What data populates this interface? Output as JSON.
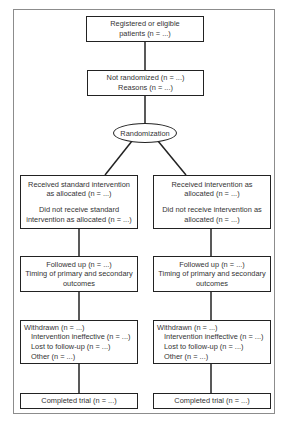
{
  "diagram": {
    "type": "flowchart",
    "title": "",
    "top": {
      "registered": {
        "lines": [
          "Registered or eligible",
          "patients (n = ...)"
        ]
      },
      "not_randomized": {
        "lines": [
          "Not randomized (n = ...)",
          "Reasons (n = ...)"
        ]
      },
      "randomization": {
        "label": "Randomization"
      }
    },
    "left_arm": {
      "allocation": {
        "lines_a": [
          "Received standard intervention",
          "as allocated (n = ...)"
        ],
        "lines_b": [
          "Did not receive standard",
          "intervention as allocated (n = ...)"
        ]
      },
      "follow_up": {
        "lines": [
          "Followed up (n = ...)",
          "Timing of primary and secondary",
          "outcomes"
        ]
      },
      "withdrawn": {
        "heading": "Withdrawn (n = ...)",
        "items": [
          "Intervention ineffective (n = ...)",
          "Lost to follow-up (n = ...)",
          "Other (n = ...)"
        ]
      },
      "completed": {
        "label": "Completed trial (n = ...)"
      }
    },
    "right_arm": {
      "allocation": {
        "lines_a": [
          "Received intervention as",
          "allocated (n = ...)"
        ],
        "lines_b": [
          "Did not receive intervention as",
          "allocated (n = ...)"
        ]
      },
      "follow_up": {
        "lines": [
          "Followed up (n = ...)",
          "Timing of primary and secondary",
          "outcomes"
        ]
      },
      "withdrawn": {
        "heading": "Withdrawn (n = ...)",
        "items": [
          "Intervention ineffective (n = ...)",
          "Lost to follow-up (n = ...)",
          "Other (n = ...)"
        ]
      },
      "completed": {
        "label": "Completed trial (n = ...)"
      }
    },
    "colors": {
      "stroke": "#222222",
      "frame": "#8c8c8c",
      "text": "#333333",
      "background": "#ffffff"
    }
  }
}
